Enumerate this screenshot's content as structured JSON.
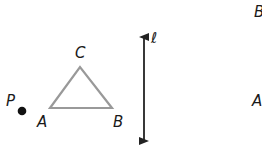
{
  "figure": {
    "triangle": {
      "vertices": {
        "A": {
          "label": "A",
          "x": 50,
          "y": 108
        },
        "B": {
          "label": "B",
          "x": 112,
          "y": 108
        },
        "C": {
          "label": "C",
          "x": 80,
          "y": 67
        }
      },
      "stroke_color": "#999999"
    },
    "point": {
      "label": "P",
      "x": 22,
      "y": 111,
      "color": "#111111"
    },
    "line": {
      "label": "ℓ",
      "x": 144,
      "y_top": 32,
      "y_bottom": 146,
      "color": "#222222"
    },
    "cropped_labels": {
      "top_right": "B",
      "mid_right": "A"
    }
  }
}
